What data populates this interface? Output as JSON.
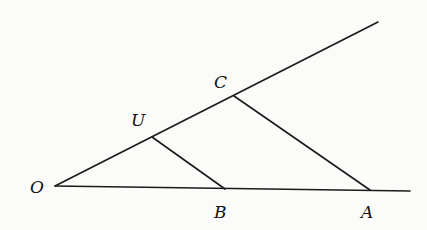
{
  "diagram": {
    "type": "geometry",
    "points": {
      "O": {
        "label": "O",
        "x": 55,
        "y": 186,
        "lx": 30,
        "ly": 193
      },
      "U": {
        "label": "U",
        "x": 152,
        "y": 137,
        "lx": 131,
        "ly": 126
      },
      "C": {
        "label": "C",
        "x": 234,
        "y": 96,
        "lx": 214,
        "ly": 88
      },
      "B": {
        "label": "B",
        "x": 225,
        "y": 189,
        "lx": 214,
        "ly": 218
      },
      "A": {
        "label": "A",
        "x": 370,
        "y": 190,
        "lx": 361,
        "ly": 218
      }
    },
    "rays": [
      {
        "name": "upper-ray",
        "x1": 55,
        "y1": 186,
        "x2": 378,
        "y2": 22
      },
      {
        "name": "base-ray",
        "x1": 55,
        "y1": 186,
        "x2": 410,
        "y2": 191
      }
    ],
    "segments": [
      {
        "name": "segment-UB",
        "from": "U",
        "to": "B"
      },
      {
        "name": "segment-CA",
        "from": "C",
        "to": "A"
      }
    ]
  }
}
